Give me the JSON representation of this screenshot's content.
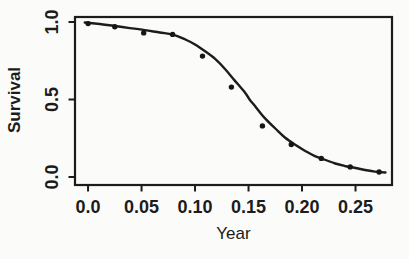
{
  "figure": {
    "background": "#fbfbf9",
    "ink": "#1c1c1c"
  },
  "chart_data": {
    "type": "scatter",
    "title": "",
    "xlabel": "Year",
    "ylabel": "Survival",
    "xlim": [
      -0.0122,
      0.2841
    ],
    "ylim": [
      -0.0516,
      1.0323
    ],
    "grid": false,
    "frame": "box",
    "x_ticks": {
      "values": [
        0,
        0.05,
        0.1,
        0.15,
        0.2,
        0.25
      ],
      "labels": [
        "0.0",
        "0.05",
        "0.10",
        "0.15",
        "0.20",
        "0.25"
      ]
    },
    "y_ticks": {
      "values": [
        0,
        0.5,
        1.0
      ],
      "labels": [
        "0.0",
        "0.5",
        "1.0"
      ]
    },
    "series": [
      {
        "name": "observed-survival-points",
        "type": "scatter",
        "x": [
          0.0,
          0.025,
          0.052,
          0.079,
          0.107,
          0.134,
          0.163,
          0.19,
          0.218,
          0.245,
          0.272
        ],
        "y": [
          0.99,
          0.97,
          0.93,
          0.92,
          0.78,
          0.58,
          0.33,
          0.21,
          0.12,
          0.065,
          0.032
        ]
      },
      {
        "name": "fitted-survival-curve",
        "type": "line",
        "x": [
          -0.003,
          0.011,
          0.025,
          0.039,
          0.053,
          0.067,
          0.079,
          0.091,
          0.1,
          0.109,
          0.119,
          0.128,
          0.137,
          0.147,
          0.151,
          0.156,
          0.165,
          0.175,
          0.184,
          0.194,
          0.203,
          0.212,
          0.222,
          0.231,
          0.24,
          0.25,
          0.259,
          0.268,
          0.278
        ],
        "y": [
          0.997,
          0.987,
          0.974,
          0.961,
          0.948,
          0.932,
          0.919,
          0.887,
          0.855,
          0.813,
          0.761,
          0.697,
          0.623,
          0.542,
          0.5,
          0.458,
          0.381,
          0.313,
          0.255,
          0.206,
          0.168,
          0.135,
          0.11,
          0.087,
          0.071,
          0.058,
          0.045,
          0.035,
          0.029
        ]
      }
    ]
  }
}
